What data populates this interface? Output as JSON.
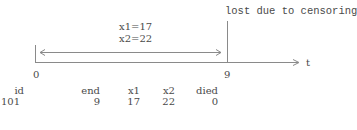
{
  "diagram": {
    "annotation_top": "lost due to censoring",
    "interval_labels": [
      "x1=17",
      "x2=22"
    ],
    "axis_label": "t",
    "tick_start": "0",
    "tick_end": "9",
    "line_color": "#8a8a8a"
  },
  "table": {
    "headers": {
      "id": "id",
      "end": "end",
      "x1": "x1",
      "x2": "x2",
      "died": "died"
    },
    "rows": [
      {
        "id": "101",
        "end": "9",
        "x1": "17",
        "x2": "22",
        "died": "0"
      }
    ]
  }
}
